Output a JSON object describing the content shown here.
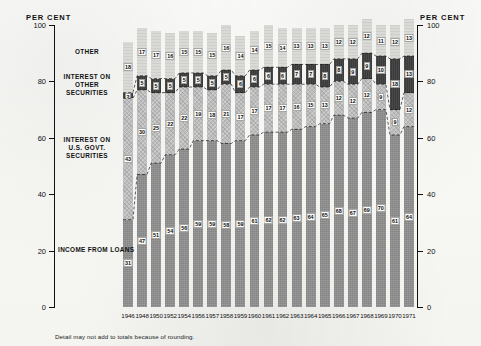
{
  "axis": {
    "unit_label_left": "PER CENT",
    "unit_label_right": "PER CENT",
    "ticks": [
      0,
      20,
      40,
      60,
      80,
      100
    ]
  },
  "series_labels": {
    "other": "OTHER",
    "interest_other_securities": "INTEREST ON OTHER SECURITIES",
    "interest_us_govt": "INTEREST ON U.S. GOVT. SECURITIES",
    "income_from_loans": "INCOME FROM LOANS"
  },
  "footnote": "Detail may not add to totals because of rounding.",
  "chart_data": {
    "type": "bar",
    "title": "",
    "subtitle": "",
    "xlabel": "",
    "ylabel": "PER CENT",
    "ylim": [
      0,
      100
    ],
    "yticks": [
      0,
      20,
      40,
      60,
      80,
      100
    ],
    "grid": false,
    "stacked": true,
    "legend_position": "inline-left",
    "categories": [
      "1946",
      "1948",
      "1950",
      "1952",
      "1954",
      "1956",
      "1957",
      "1958",
      "1959",
      "1960",
      "1961",
      "1962",
      "1963",
      "1964",
      "1965",
      "1966",
      "1967",
      "1968",
      "1969",
      "1970",
      "1971"
    ],
    "series": [
      {
        "name": "INCOME FROM LOANS",
        "color": "#8e8e8e",
        "values": [
          31,
          47,
          51,
          54,
          56,
          59,
          59,
          58,
          59,
          61,
          62,
          62,
          63,
          64,
          65,
          68,
          67,
          69,
          70,
          61,
          64
        ]
      },
      {
        "name": "INTEREST ON U.S. GOVT. SECURITIES",
        "color": "#bdbdbd",
        "values": [
          43,
          30,
          25,
          22,
          22,
          19,
          18,
          21,
          17,
          17,
          17,
          17,
          16,
          15,
          13,
          12,
          12,
          12,
          9,
          9,
          12
        ]
      },
      {
        "name": "INTEREST ON OTHER SECURITIES",
        "color": "#3b3b3b",
        "values": [
          2,
          5,
          5,
          5,
          5,
          5,
          5,
          5,
          6,
          6,
          6,
          6,
          7,
          7,
          8,
          8,
          9,
          9,
          10,
          18,
          13
        ]
      },
      {
        "name": "OTHER",
        "color": "#d9d9d6",
        "values": [
          18,
          17,
          17,
          16,
          15,
          15,
          15,
          16,
          14,
          14,
          15,
          14,
          13,
          13,
          13,
          12,
          12,
          12,
          11,
          12,
          13
        ]
      }
    ],
    "labeled_values": {
      "other": [
        18,
        17,
        17,
        16,
        15,
        15,
        15,
        16,
        14,
        14,
        15,
        14,
        13,
        13,
        13,
        12,
        12,
        12,
        11,
        12,
        13
      ],
      "interest_other_securities": [
        2,
        5,
        5,
        5,
        5,
        5,
        5,
        5,
        6,
        6,
        6,
        6,
        7,
        7,
        8,
        8,
        9,
        9,
        10,
        18,
        13
      ],
      "interest_us_govt": [
        43,
        30,
        25,
        22,
        22,
        19,
        18,
        21,
        17,
        17,
        17,
        17,
        16,
        15,
        13,
        12,
        12,
        12,
        9,
        9,
        12
      ],
      "income_from_loans": [
        31,
        47,
        51,
        54,
        56,
        59,
        59,
        58,
        59,
        61,
        62,
        62,
        63,
        64,
        65,
        68,
        67,
        69,
        70,
        61,
        64
      ]
    }
  }
}
